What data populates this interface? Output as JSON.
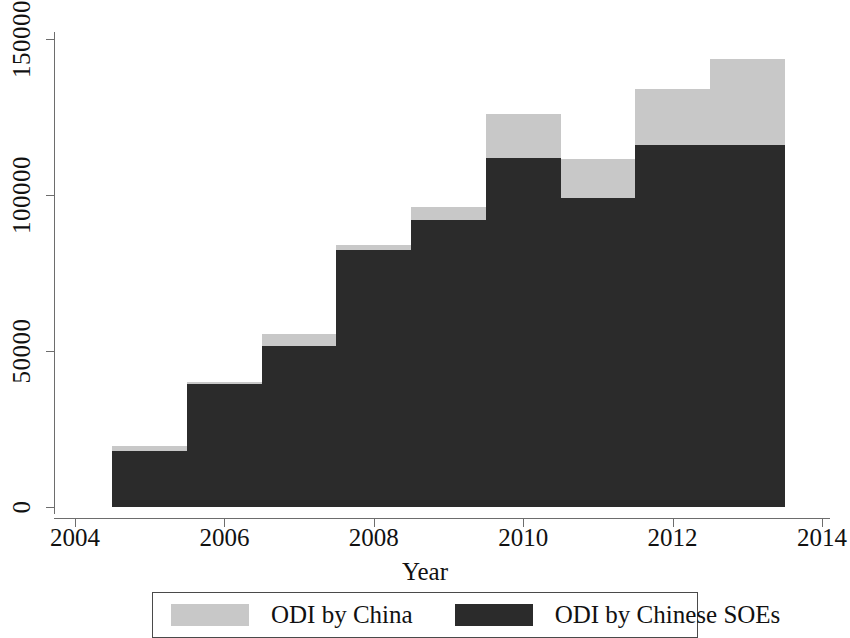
{
  "chart_data": {
    "type": "bar",
    "stacked": true,
    "title": "",
    "subtitle": "",
    "xlabel": "Year",
    "ylabel": "",
    "grid": false,
    "legend_position": "bottom",
    "categories": [
      2005,
      2006,
      2007,
      2008,
      2009,
      2010,
      2011,
      2012,
      2013
    ],
    "x_tick_labels": [
      "2004",
      "2006",
      "2008",
      "2010",
      "2012",
      "2014"
    ],
    "x_tick_values": [
      2004,
      2006,
      2008,
      2010,
      2012,
      2014
    ],
    "y_tick_labels": [
      "0",
      "50000",
      "100000",
      "150000"
    ],
    "y_tick_values": [
      0,
      50000,
      100000,
      150000
    ],
    "xlim": [
      2004,
      2014
    ],
    "ylim": [
      0,
      150000
    ],
    "series": [
      {
        "name": "ODI by China",
        "color": "#c8c8c8",
        "values": [
          19500,
          40000,
          55500,
          84000,
          96000,
          126000,
          111500,
          134000,
          143500
        ]
      },
      {
        "name": "ODI by Chinese SOEs",
        "color": "#2b2b2b",
        "values": [
          18000,
          39500,
          51500,
          82500,
          92000,
          112000,
          99000,
          116000,
          116000
        ]
      }
    ]
  },
  "axes": {
    "x_title": "Year",
    "x_ticks": [
      "2004",
      "2006",
      "2008",
      "2010",
      "2012",
      "2014"
    ],
    "y_ticks": [
      "0",
      "50000",
      "100000",
      "150000"
    ]
  },
  "legend": {
    "items": [
      {
        "label": "ODI by China",
        "color": "#c8c8c8"
      },
      {
        "label": "ODI by Chinese SOEs",
        "color": "#2b2b2b"
      }
    ]
  }
}
